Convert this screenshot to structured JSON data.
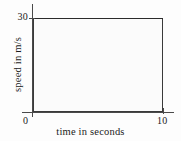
{
  "chart_data": {
    "type": "area",
    "title": "",
    "subtitle": "",
    "xlabel": "time in seconds",
    "ylabel": "speed in m/s",
    "xlim": [
      0,
      10
    ],
    "ylim": [
      0,
      30
    ],
    "xticks": [
      "0",
      "10"
    ],
    "xtick_values": [
      0,
      10
    ],
    "yticks": [
      "30"
    ],
    "ytick_values": [
      30
    ],
    "grid": false,
    "legend": null,
    "annotations": [],
    "series": [
      {
        "name": "speed",
        "x": [
          0,
          10
        ],
        "values": [
          30,
          30
        ],
        "fill": true,
        "fill_style": "dotted-stipple",
        "description": "constant speed of 30 m/s held for 10 seconds; region beneath the line is shaded"
      }
    ],
    "shaded_region": {
      "x_start": 0,
      "x_end": 10,
      "y_bottom": 0,
      "y_top": 30,
      "area_value": 300,
      "area_units": "m"
    },
    "colors": {
      "line": "#2b2b2b",
      "axis": "#4a4a4a",
      "fill_dots": "#8e8e8e",
      "fill_background": "#fbfbfb",
      "page_background": "#fdfdfd",
      "text": "#1b1b1b"
    }
  },
  "axes": {
    "y": {
      "title": "speed in m/s",
      "max_label": "30"
    },
    "x": {
      "title": "time in seconds",
      "min_label": "0",
      "max_label": "10"
    }
  }
}
